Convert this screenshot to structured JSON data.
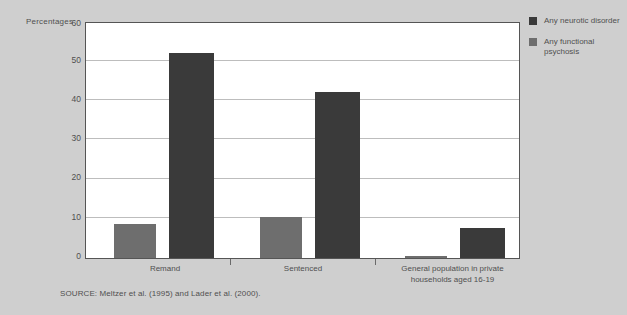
{
  "figure": {
    "axis_title": "Percentages",
    "source_note": "SOURCE: Meltzer et al. (1995) and Lader et al. (2000)."
  },
  "legend": {
    "items": [
      {
        "label": "Any neurotic disorder",
        "color": "#3a3a3a",
        "swatch": "legend-swatch-dark"
      },
      {
        "label": "Any functional psychosis",
        "color": "#6e6e6e",
        "swatch": "legend-swatch-light"
      }
    ]
  },
  "chart_data": {
    "type": "bar",
    "title": "",
    "xlabel": "",
    "ylabel": "Percentages",
    "ylim": [
      0,
      60
    ],
    "yticks": [
      0,
      10,
      20,
      30,
      40,
      50,
      60
    ],
    "ytick_labels": [
      "0",
      "10",
      "20",
      "30",
      "40",
      "50",
      "60"
    ],
    "grid": true,
    "legend_position": "right",
    "categories": [
      "Remand",
      "Sentenced",
      "General population  in private households aged 16-19"
    ],
    "series": [
      {
        "name": "Any functional psychosis",
        "color": "#6e6e6e",
        "values": [
          8.5,
          10.5,
          0.5
        ]
      },
      {
        "name": "Any neurotic disorder",
        "color": "#3a3a3a",
        "values": [
          52.5,
          42.5,
          7.5
        ]
      }
    ],
    "colors": {
      "background": "#cfcfcf",
      "plot_area": "#ffffff",
      "gridline": "#bdbdbd",
      "frame": "#555555"
    }
  }
}
